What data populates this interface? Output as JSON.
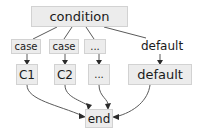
{
  "diagram": {
    "canvas": {
      "width": 210,
      "height": 132,
      "background": "#ffffff"
    },
    "style": {
      "node_fill": "#ececec",
      "node_border": "#d2d2d2",
      "text_color": "#1b1b1b",
      "edge_color": "#5a5a5a",
      "arrowhead_color": "#2b2b2b"
    },
    "nodes": {
      "condition": {
        "label": "condition",
        "shape": "box"
      },
      "case_1": {
        "label": "case",
        "shape": "box"
      },
      "case_2": {
        "label": "case",
        "shape": "box"
      },
      "ellipsis_label": {
        "label": "...",
        "shape": "box"
      },
      "default_label": {
        "label": "default",
        "shape": "plain-text"
      },
      "c1": {
        "label": "C1",
        "shape": "box"
      },
      "c2": {
        "label": "C2",
        "shape": "box"
      },
      "ellipsis_body": {
        "label": "...",
        "shape": "box"
      },
      "default_body": {
        "label": "default",
        "shape": "box"
      },
      "end": {
        "label": "end",
        "shape": "box"
      }
    },
    "edges": [
      {
        "from": "condition",
        "to": "case_1",
        "arrow": false
      },
      {
        "from": "condition",
        "to": "case_2",
        "arrow": false
      },
      {
        "from": "condition",
        "to": "ellipsis_label",
        "arrow": false
      },
      {
        "from": "condition",
        "to": "default_label",
        "arrow": false
      },
      {
        "from": "case_1",
        "to": "c1",
        "arrow": true
      },
      {
        "from": "case_2",
        "to": "c2",
        "arrow": true
      },
      {
        "from": "ellipsis_label",
        "to": "ellipsis_body",
        "arrow": true
      },
      {
        "from": "default_label",
        "to": "default_body",
        "arrow": true
      },
      {
        "from": "c1",
        "to": "end",
        "arrow": true
      },
      {
        "from": "c2",
        "to": "end",
        "arrow": true
      },
      {
        "from": "ellipsis_body",
        "to": "end",
        "arrow": true
      },
      {
        "from": "default_body",
        "to": "end",
        "arrow": true
      }
    ]
  }
}
